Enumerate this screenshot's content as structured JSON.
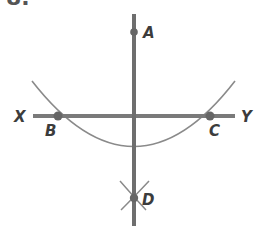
{
  "figure": {
    "cut_label": "8.",
    "colors": {
      "line": "#7a7a7a",
      "arc": "#8a8a8a",
      "point": "#666666",
      "label": "#3c3c3c"
    },
    "lines": [
      {
        "name": "XY",
        "from": "X",
        "to": "Y"
      },
      {
        "name": "AD",
        "from": "A",
        "to": "D"
      }
    ],
    "points": [
      {
        "id": "A",
        "label": "A",
        "on": "vertical line (top)"
      },
      {
        "id": "B",
        "label": "B",
        "on": "line XY, arc intersection (left)"
      },
      {
        "id": "C",
        "label": "C",
        "on": "line XY, arc intersection (right)"
      },
      {
        "id": "D",
        "label": "D",
        "on": "vertical line, intersection of arcs"
      }
    ],
    "line_end_labels": [
      {
        "id": "X",
        "label": "X"
      },
      {
        "id": "Y",
        "label": "Y"
      }
    ]
  }
}
